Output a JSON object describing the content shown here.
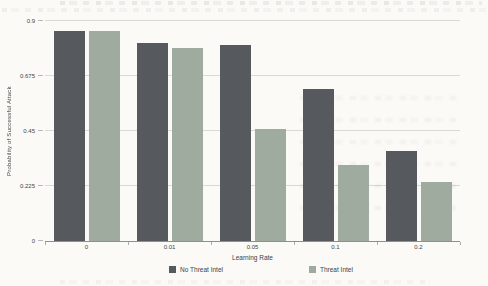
{
  "chart_data": {
    "type": "bar",
    "title": "",
    "xlabel": "Learning Rate",
    "ylabel": "Probability of Successful Attack",
    "categories": [
      "0",
      "0.01",
      "0.05",
      "0.1",
      "0.2"
    ],
    "series": [
      {
        "name": "No Threat Intel",
        "color": "#565a5e",
        "values": [
          0.86,
          0.81,
          0.8,
          0.62,
          0.37
        ]
      },
      {
        "name": "Threat Intel",
        "color": "#9fab9f",
        "values": [
          0.86,
          0.79,
          0.46,
          0.31,
          0.24
        ]
      }
    ],
    "ylim": [
      0,
      0.9
    ],
    "y_ticks": [
      0,
      0.225,
      0.45,
      0.675,
      0.9
    ],
    "grid": true,
    "legend_position": "bottom",
    "colors": {
      "gridline": "#d9d9d5",
      "axis": "#8f8f8c",
      "text": "#3b3b3b",
      "paper": "#fbfaf7"
    }
  }
}
